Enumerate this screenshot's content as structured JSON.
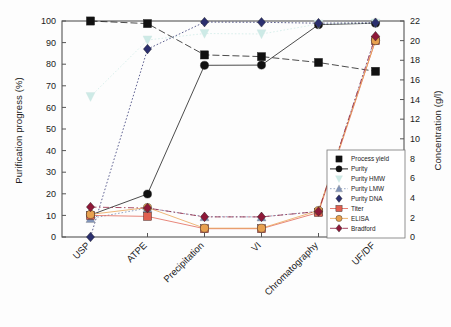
{
  "chart_data": {
    "type": "line",
    "title": "",
    "xlabel": "",
    "ylabel": "Purification progress (%)",
    "ylabel_right": "Concentration (g/l)",
    "categories": [
      "USP",
      "ATPE",
      "Precipitation",
      "VI",
      "Chromatography",
      "UF/DF"
    ],
    "ylim": [
      0,
      100
    ],
    "yticks": [
      0,
      10,
      20,
      30,
      40,
      50,
      60,
      70,
      80,
      90,
      100
    ],
    "ylim_right": [
      0,
      22
    ],
    "yticks_right": [
      0,
      2,
      4,
      6,
      8,
      10,
      12,
      14,
      16,
      18,
      20,
      22
    ],
    "grid": false,
    "legend_position": "lower-right",
    "series": [
      {
        "name": "Process yield",
        "axis": "left",
        "color": "#111111",
        "marker": "square",
        "line": "dashed",
        "values": [
          100,
          98.8,
          84.3,
          83.5,
          80.8,
          76.7
        ]
      },
      {
        "name": "Purity",
        "axis": "left",
        "color": "#111111",
        "marker": "circle",
        "line": "solid",
        "values": [
          10.2,
          19.9,
          79.5,
          79.6,
          98.3,
          99.0
        ]
      },
      {
        "name": "Purity HMW",
        "axis": "left",
        "color": "#cdeae6",
        "marker": "triangle-down",
        "line": "dotted",
        "values": [
          65.0,
          91.2,
          94.2,
          94.0,
          98.6,
          99.0
        ]
      },
      {
        "name": "Purity LMW",
        "axis": "left",
        "color": "#8093b8",
        "marker": "triangle-up",
        "line": "dotted",
        "values": [
          8.6,
          13.4,
          9.4,
          9.3,
          11.9,
          92.9
        ]
      },
      {
        "name": "Purity DNA",
        "axis": "left",
        "color": "#2b2f6e",
        "marker": "diamond",
        "line": "dotted",
        "values": [
          0.0,
          87.0,
          99.5,
          99.4,
          99.0,
          99.2
        ]
      },
      {
        "name": "Titer",
        "axis": "right",
        "color": "#e06050",
        "marker": "square",
        "line": "solid",
        "values": [
          2.2,
          2.1,
          0.85,
          0.85,
          2.5,
          20.0
        ]
      },
      {
        "name": "ELISA",
        "axis": "right",
        "color": "#e8a14f",
        "marker": "circle",
        "line": "solid",
        "values": [
          2.3,
          3.0,
          0.9,
          0.9,
          2.7,
          20.0
        ]
      },
      {
        "name": "Bradford",
        "axis": "right",
        "color": "#8e1838",
        "marker": "diamond",
        "line": "dash-dot",
        "values": [
          3.05,
          2.95,
          2.05,
          2.05,
          2.6,
          20.45
        ]
      }
    ]
  },
  "axes": {
    "left_title": "Purification progress (%)",
    "right_title": "Concentration (g/l)"
  },
  "legend": {
    "items": [
      {
        "label": "Process yield"
      },
      {
        "label": "Purity"
      },
      {
        "label": "Purity HMW"
      },
      {
        "label": "Purity LMW"
      },
      {
        "label": "Purity DNA"
      },
      {
        "label": "Titer"
      },
      {
        "label": "ELISA"
      },
      {
        "label": "Bradford"
      }
    ]
  }
}
